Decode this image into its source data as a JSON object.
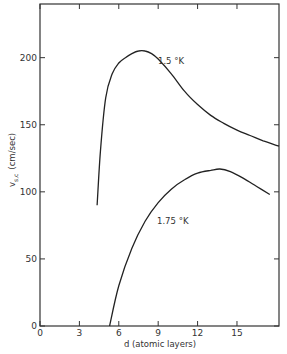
{
  "chart_data": {
    "type": "line",
    "title": "",
    "xlabel": "d (atomic layers)",
    "ylabel": "v_s,c (cm/sec)",
    "xlim": [
      0,
      18.2
    ],
    "ylim": [
      0,
      240
    ],
    "xticks": [
      "0",
      "3",
      "6",
      "9",
      "12",
      "15"
    ],
    "yticks": [
      "0",
      "50",
      "100",
      "150",
      "200"
    ],
    "grid": false,
    "legend": "inline curve labels",
    "series": [
      {
        "name": "1.5 °K",
        "label": "1.5 °K",
        "x": [
          4.35,
          4.6,
          5.0,
          5.5,
          6.0,
          6.5,
          7.0,
          7.5,
          8.0,
          8.5,
          9.0,
          10.0,
          11.0,
          12.0,
          13.0,
          14.0,
          15.0,
          16.0,
          17.0,
          18.2
        ],
        "y": [
          90,
          130,
          170,
          188,
          196,
          200,
          203,
          205,
          205,
          203,
          199,
          188,
          175,
          165,
          157,
          151,
          146,
          142,
          138,
          134
        ]
      },
      {
        "name": "1.75 °K",
        "label": "1.75 °K",
        "x": [
          5.3,
          6.0,
          7.0,
          8.0,
          9.0,
          10.0,
          11.0,
          12.0,
          13.0,
          13.7,
          14.5,
          15.5,
          16.5,
          17.5
        ],
        "y": [
          0,
          30,
          58,
          78,
          92,
          102,
          109,
          114,
          116,
          117,
          115,
          110,
          104,
          98
        ]
      }
    ]
  },
  "labels": {
    "xlabel": "d (atomic layers)",
    "ylabel_main": "v",
    "ylabel_sub": "s,c",
    "ylabel_unit": "(cm/sec)",
    "curve1": "1.5 °K",
    "curve2": "1.75 °K"
  }
}
